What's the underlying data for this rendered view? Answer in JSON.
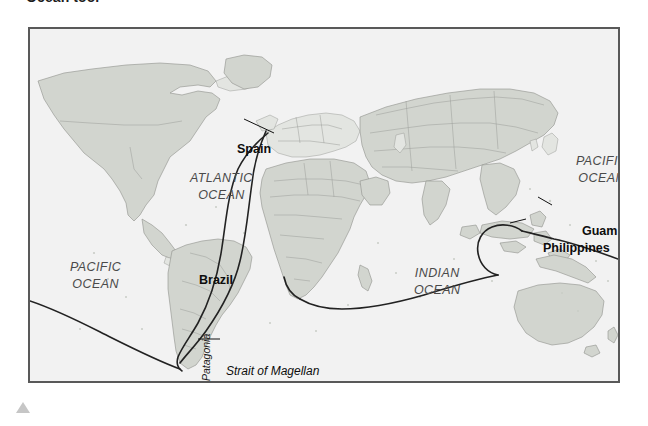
{
  "caption": {
    "text": "Ocean tool"
  },
  "map": {
    "title": "World map showing Magellan circumnavigation route",
    "background_color": "#f2f2f2",
    "land_color": "#d2d5cf",
    "land_border_color": "#8e918c",
    "route_color": "#222222",
    "frame_color": "#595959",
    "ocean_labels": [
      {
        "name": "pacific-ocean-west",
        "lines": [
          "PACIFIC",
          "OCEAN"
        ],
        "x": 40,
        "y": 232
      },
      {
        "name": "atlantic-ocean",
        "lines": [
          "ATLANTIC",
          "OCEAN"
        ],
        "x": 160,
        "y": 143
      },
      {
        "name": "indian-ocean",
        "lines": [
          "INDIAN",
          "OCEAN"
        ],
        "x": 384,
        "y": 238
      },
      {
        "name": "pacific-ocean-east",
        "lines": [
          "PACIFIC",
          "OCEAN"
        ],
        "x": 546,
        "y": 126
      }
    ],
    "place_labels": [
      {
        "name": "spain",
        "text": "Spain",
        "x": 207,
        "y": 114
      },
      {
        "name": "brazil",
        "text": "Brazil",
        "x": 169,
        "y": 245
      },
      {
        "name": "guam",
        "text": "Guam",
        "x": 552,
        "y": 196
      },
      {
        "name": "philippines",
        "text": "Philippines",
        "x": 513,
        "y": 213
      }
    ],
    "feature_labels": [
      {
        "name": "strait-of-magellan",
        "text": "Strait of Magellan",
        "x": 196,
        "y": 336
      }
    ],
    "rotated_labels": [
      {
        "name": "patagonia",
        "text": "Patagonia",
        "x": 171,
        "y": 352
      }
    ]
  },
  "marker": {
    "name": "scroll-indicator",
    "shape": "triangle-up",
    "color": "#c6c6c6"
  }
}
